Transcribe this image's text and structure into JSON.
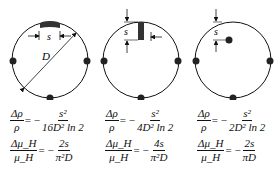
{
  "configs": [
    {
      "id": "edge-contact",
      "labels": {
        "s": "s",
        "D": "D"
      },
      "formula1": {
        "num": "Δρ",
        "den": "ρ",
        "eq": "= −",
        "rnum": "s²",
        "rden": "16D² ln 2"
      },
      "formula2": {
        "num": "Δμ_H",
        "den": "μ_H",
        "eq": "= −",
        "rnum": "2s",
        "rden": "π²D"
      }
    },
    {
      "id": "radial-contact",
      "labels": {
        "s": "s"
      },
      "formula1": {
        "num": "Δρ",
        "den": "ρ",
        "eq": "= −",
        "rnum": "s²",
        "rden": "4D² ln 2"
      },
      "formula2": {
        "num": "Δμ_H",
        "den": "μ_H",
        "eq": "= −",
        "rnum": "4s",
        "rden": "π²D"
      }
    },
    {
      "id": "inset-contact",
      "labels": {
        "s": "s"
      },
      "formula1": {
        "num": "Δρ",
        "den": "ρ",
        "eq": "= −",
        "rnum": "s²",
        "rden": "2D² ln 2"
      },
      "formula2": {
        "num": "Δμ_H",
        "den": "μ_H",
        "eq": "= −",
        "rnum": "2s",
        "rden": "πD"
      }
    }
  ]
}
